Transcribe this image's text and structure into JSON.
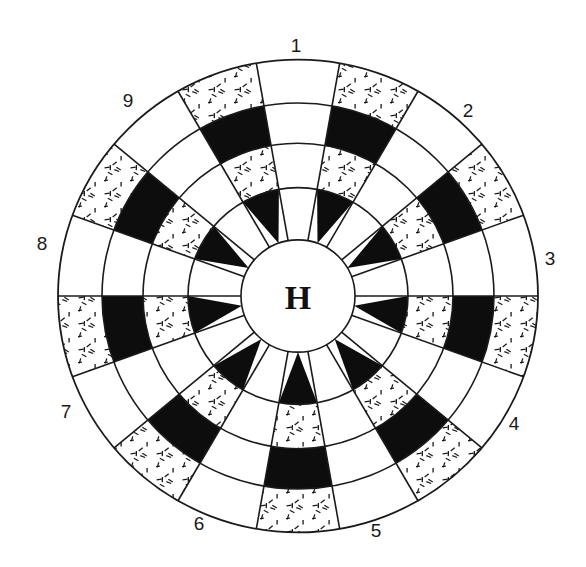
{
  "diagram": {
    "center": {
      "x": 298,
      "y": 296
    },
    "y_scale": 0.985,
    "radii": [
      57,
      110,
      155,
      196,
      240
    ],
    "hub_label": "H",
    "sector_count": 18,
    "start_angle_deg": -100,
    "colors": {
      "line": "#1a1a1a",
      "black": "#0d0d0d",
      "white": "#ffffff",
      "stipple": "#1a1a1a"
    },
    "sectors": [
      {
        "label": "1",
        "type": "plain"
      },
      {
        "type": "pattern"
      },
      {
        "label": "2",
        "type": "plain"
      },
      {
        "type": "pattern"
      },
      {
        "label": "3",
        "type": "plain"
      },
      {
        "type": "pattern"
      },
      {
        "label": "4",
        "type": "plain"
      },
      {
        "type": "pattern"
      },
      {
        "label": "5",
        "type": "plain"
      },
      {
        "type": "pattern"
      },
      {
        "label": "6",
        "type": "plain"
      },
      {
        "type": "pattern"
      },
      {
        "label": "7",
        "type": "plain"
      },
      {
        "type": "pattern"
      },
      {
        "label": "8",
        "type": "plain"
      },
      {
        "type": "pattern"
      },
      {
        "label": "9",
        "type": "plain"
      },
      {
        "type": "pattern"
      }
    ],
    "pattern_rings_inner_to_outer": [
      "black-triangle",
      "stipple",
      "black",
      "stipple"
    ],
    "plain_rings_inner_to_outer": [
      "white",
      "white",
      "white",
      "white"
    ],
    "labels": [
      {
        "text": "1",
        "x": 296,
        "y": 45
      },
      {
        "text": "2",
        "x": 468,
        "y": 110
      },
      {
        "text": "3",
        "x": 550,
        "y": 258
      },
      {
        "text": "4",
        "x": 514,
        "y": 423
      },
      {
        "text": "5",
        "x": 376,
        "y": 530
      },
      {
        "text": "6",
        "x": 199,
        "y": 523
      },
      {
        "text": "7",
        "x": 66,
        "y": 411
      },
      {
        "text": "8",
        "x": 42,
        "y": 243
      },
      {
        "text": "9",
        "x": 128,
        "y": 100
      }
    ]
  }
}
